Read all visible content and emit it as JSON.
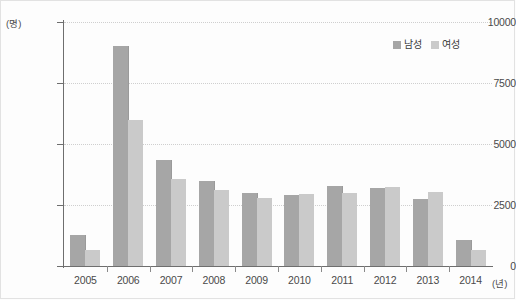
{
  "chart_data": {
    "type": "bar",
    "title": "",
    "xlabel": "(년)",
    "ylabel": "(명)",
    "categories": [
      "2005",
      "2006",
      "2007",
      "2008",
      "2009",
      "2010",
      "2011",
      "2012",
      "2013",
      "2014"
    ],
    "series": [
      {
        "name": "남성",
        "color": "#a6a6a6",
        "values": [
          1270,
          9000,
          4350,
          3500,
          3000,
          2900,
          3270,
          3200,
          2750,
          1050
        ]
      },
      {
        "name": "여성",
        "color": "#cacaca",
        "values": [
          650,
          6000,
          3550,
          3100,
          2800,
          2950,
          2990,
          3230,
          3050,
          650
        ]
      }
    ],
    "ylim": [
      0,
      10000
    ],
    "yticks": [
      0,
      2500,
      5000,
      7500,
      10000
    ],
    "ytick_labels": [
      "0",
      "2500",
      "5000",
      "7500",
      "10000"
    ],
    "grid": true,
    "legend_position": "top-right"
  },
  "axes": {
    "y_unit": "(명)",
    "x_unit": "(년)"
  }
}
